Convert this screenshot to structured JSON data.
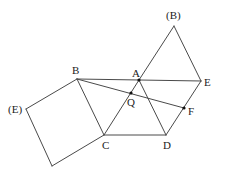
{
  "diagram": {
    "type": "geometry-figure",
    "stroke_color": "#4a4a4a",
    "points": {
      "B": {
        "label": "B",
        "x": 77,
        "y": 79
      },
      "A": {
        "label": "A",
        "x": 139,
        "y": 80
      },
      "E": {
        "label": "E",
        "x": 201,
        "y": 81
      },
      "B_prime": {
        "label": "(B)",
        "x": 174,
        "y": 26
      },
      "E_prime": {
        "label": "(E)",
        "x": 26,
        "y": 109
      },
      "C": {
        "label": "C",
        "x": 104,
        "y": 135
      },
      "D": {
        "label": "D",
        "x": 166,
        "y": 135
      },
      "Q": {
        "label": "Q",
        "x": 131,
        "y": 93
      },
      "F": {
        "label": "F",
        "x": 184,
        "y": 108
      },
      "S": {
        "label": "",
        "x": 52,
        "y": 166
      }
    },
    "segments": [
      [
        "B",
        "E"
      ],
      [
        "B",
        "F"
      ],
      [
        "B",
        "C"
      ],
      [
        "C",
        "D"
      ],
      [
        "C",
        "A"
      ],
      [
        "A",
        "B_prime"
      ],
      [
        "B_prime",
        "E"
      ],
      [
        "E",
        "D"
      ],
      [
        "A",
        "D"
      ],
      [
        "B",
        "E_prime"
      ],
      [
        "E_prime",
        "S"
      ],
      [
        "S",
        "C"
      ]
    ],
    "marked_points": [
      "A",
      "Q",
      "F"
    ],
    "labels": [
      {
        "key": "B",
        "text": "B"
      },
      {
        "key": "A",
        "text": "A"
      },
      {
        "key": "E",
        "text": "E"
      },
      {
        "key": "B_prime",
        "text": "(B)"
      },
      {
        "key": "E_prime",
        "text": "(E)"
      },
      {
        "key": "C",
        "text": "C"
      },
      {
        "key": "D",
        "text": "D"
      },
      {
        "key": "Q",
        "text": "Q"
      },
      {
        "key": "F",
        "text": "F"
      }
    ]
  }
}
